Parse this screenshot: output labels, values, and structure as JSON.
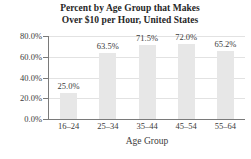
{
  "chart_data": {
    "type": "bar",
    "title": "Percent by Age Group that Makes Over $10 per Hour, United States",
    "title_lines": [
      "Percent by Age Group that Makes",
      "Over $10 per Hour, United States"
    ],
    "categories": [
      "16–24",
      "25–34",
      "35–44",
      "45–54",
      "55–64"
    ],
    "values": [
      25.0,
      63.5,
      71.5,
      72.0,
      65.2
    ],
    "value_labels": [
      "25.0%",
      "63.5%",
      "71.5%",
      "72.0%",
      "65.2%"
    ],
    "xlabel": "Age Group",
    "ylabel": "",
    "ylim": [
      0,
      80
    ],
    "ytick_values": [
      0,
      20,
      40,
      60,
      80
    ],
    "ytick_labels": [
      "0.0%",
      "20.0%",
      "40.0%",
      "60.0%",
      "80.0%"
    ],
    "grid": true,
    "legend": false,
    "bar_color": "#e7e7e7",
    "gridline_color": "#e2e2e2",
    "axis_color": "#7a7a7a",
    "text_color": "#3b3b3b",
    "background": "#ffffff"
  }
}
